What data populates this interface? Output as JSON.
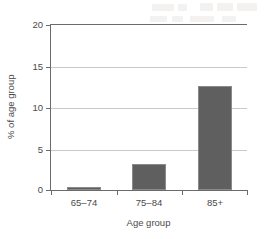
{
  "chart_data": {
    "type": "bar",
    "title": "",
    "xlabel": "Age group",
    "ylabel": "% of age group",
    "categories": [
      "65–74",
      "75–84",
      "85+"
    ],
    "values": [
      0.4,
      3.1,
      12.6
    ],
    "series": [
      {
        "name": "% of age group",
        "values": [
          0.4,
          3.1,
          12.6
        ]
      }
    ],
    "ylim": [
      0,
      20
    ],
    "yticks": [
      0,
      5,
      10,
      15,
      20
    ],
    "ytick_labels": [
      "0",
      "5",
      "10",
      "15",
      "20"
    ],
    "grid": "horizontal",
    "legend": "none",
    "bar_color": "#5f5f5f",
    "gridline_color": "#c9c9c9",
    "axis_color": "#6b6b6b"
  }
}
